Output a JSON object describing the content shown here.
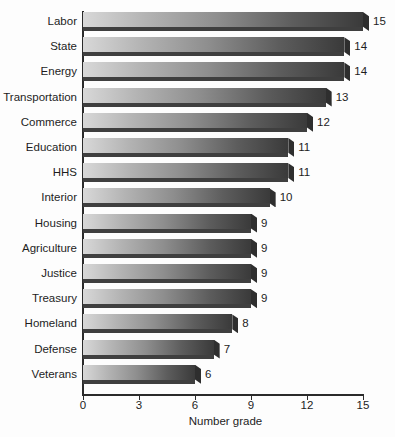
{
  "chart_data": {
    "type": "bar",
    "orientation": "horizontal",
    "title": "",
    "xlabel": "Number grade",
    "ylabel": "",
    "categories": [
      "Labor",
      "State",
      "Energy",
      "Transportation",
      "Commerce",
      "Education",
      "HHS",
      "Interior",
      "Housing",
      "Agriculture",
      "Justice",
      "Treasury",
      "Homeland",
      "Defense",
      "Veterans"
    ],
    "values": [
      15,
      14,
      14,
      13,
      12,
      11,
      11,
      10,
      9,
      9,
      9,
      9,
      8,
      7,
      6
    ],
    "data_labels": [
      "15",
      "14",
      "14",
      "13",
      "12",
      "11",
      "11",
      "10",
      "9",
      "9",
      "9",
      "9",
      "8",
      "7",
      "6"
    ],
    "xlim": [
      0,
      15
    ],
    "xticks": [
      0,
      3,
      6,
      9,
      12,
      15
    ],
    "xtick_labels": [
      "0",
      "3",
      "6",
      "9",
      "12",
      "15"
    ],
    "grid": false,
    "legend": null,
    "bar_style": "3d-gradient",
    "colors": {
      "bar_light": "#d8d8d8",
      "bar_dark": "#3a3a3a",
      "bar_face": "#3f3f3f",
      "axis": "#2b2b2b",
      "text": "#1d1d1d",
      "background": "#fdfdfd"
    }
  }
}
